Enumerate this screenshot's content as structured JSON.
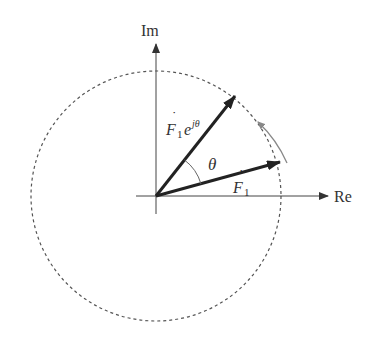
{
  "diagram": {
    "type": "phasor-rotation",
    "axes": {
      "real_label": "Re",
      "imag_label": "Im"
    },
    "vectors": [
      {
        "name": "F1",
        "label_base": "F",
        "label_sub": "1",
        "dot": "˙"
      },
      {
        "name": "F1e^jθ",
        "label_base": "F",
        "label_sub": "1",
        "label_exp_base": "e",
        "label_exp": "jθ",
        "dot": "˙"
      }
    ],
    "angle_label": "θ",
    "circle": "dashed",
    "rotation_arrow": "counter-clockwise",
    "colors": {
      "vector": "#222222",
      "axis": "#444444",
      "circle": "#555555",
      "rotation_arrow": "#888888"
    }
  }
}
